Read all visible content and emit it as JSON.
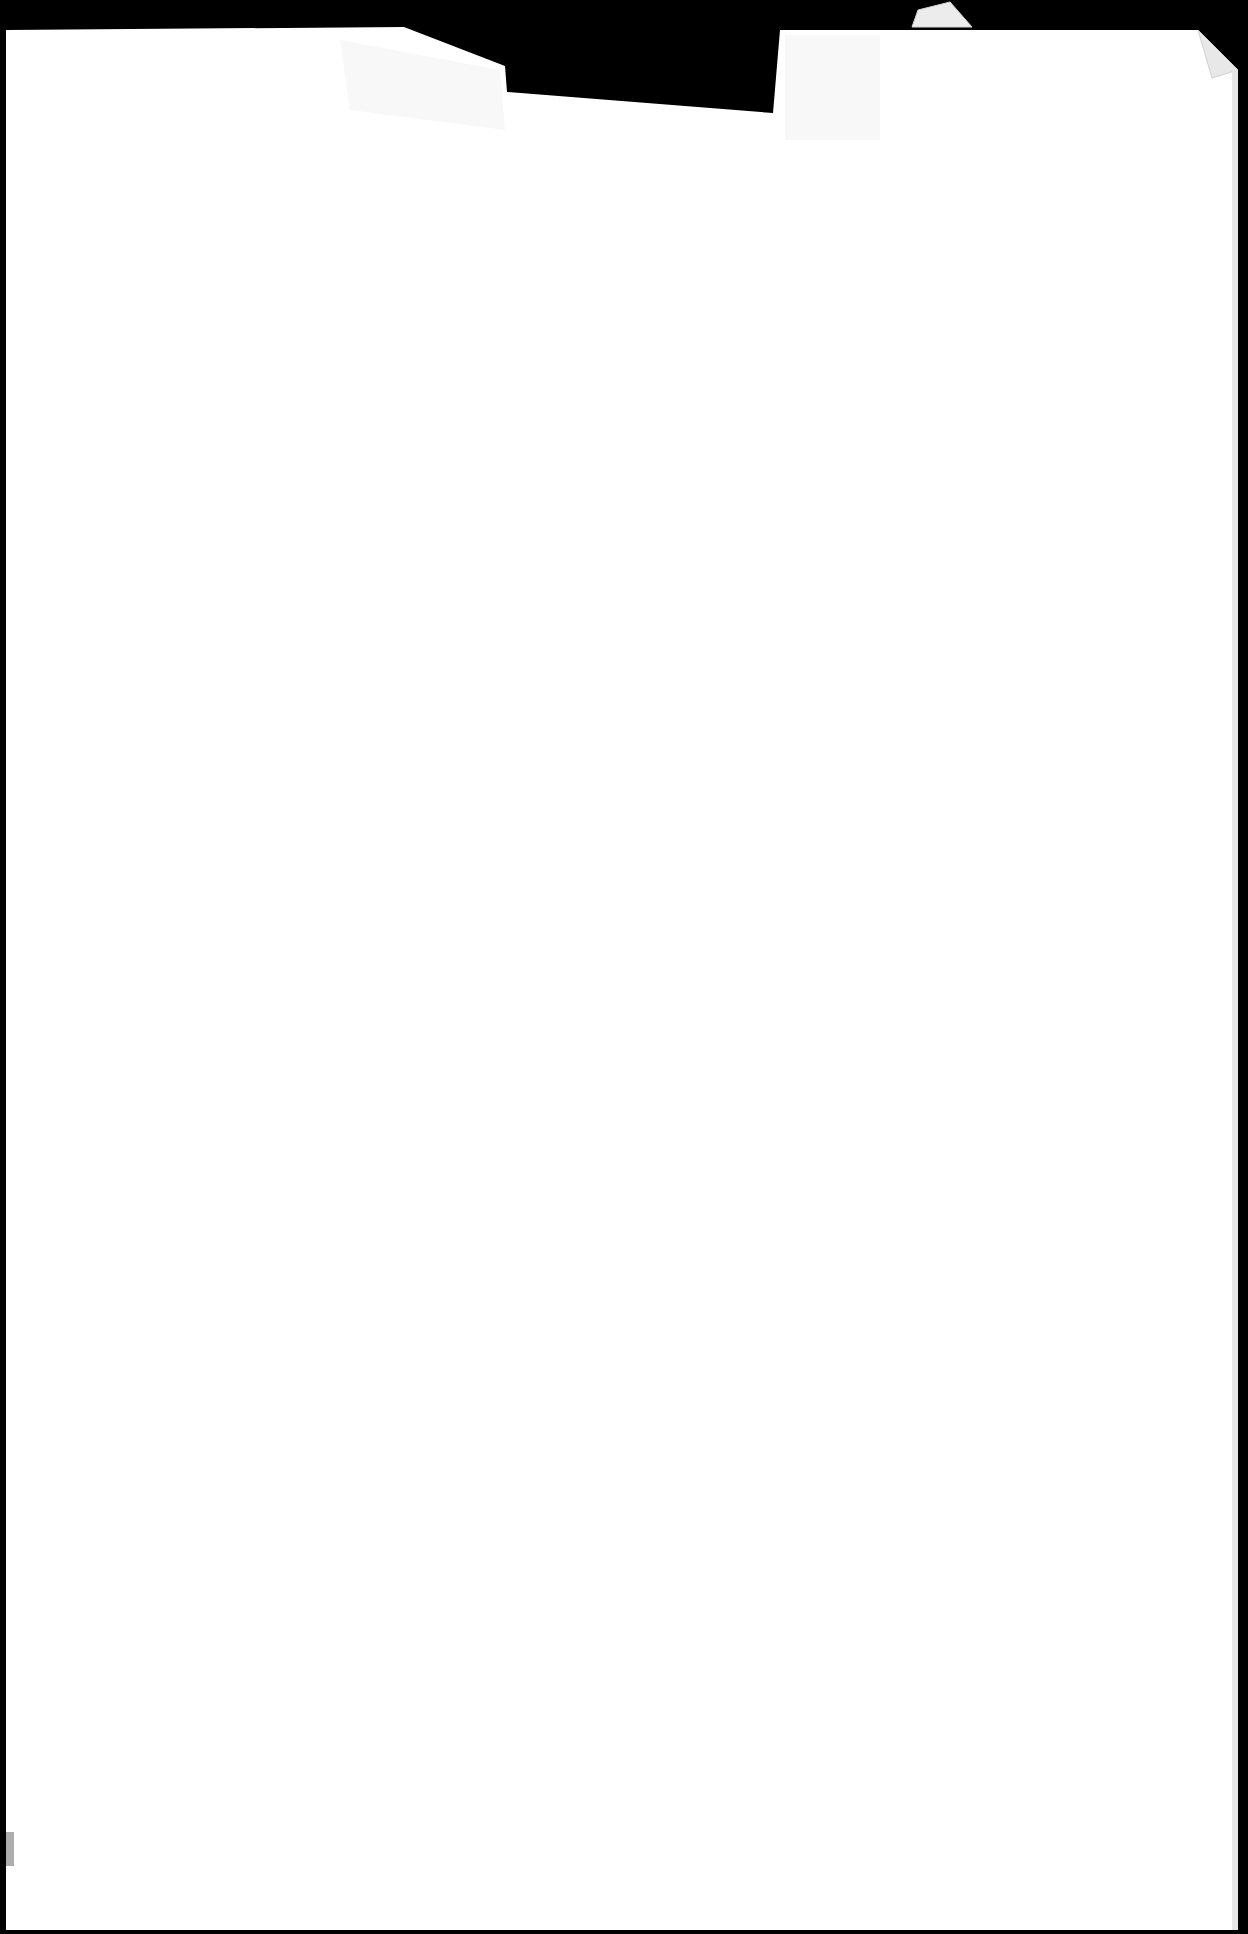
{
  "document": {
    "kind": "scanned blank page",
    "text_content": "",
    "background_color": "#000000",
    "paper_color": "#ffffff",
    "features": [
      "torn notch along top edge",
      "folded top-right corner",
      "small folded scrap above top edge",
      "faint grey mark near bottom-left edge"
    ]
  }
}
